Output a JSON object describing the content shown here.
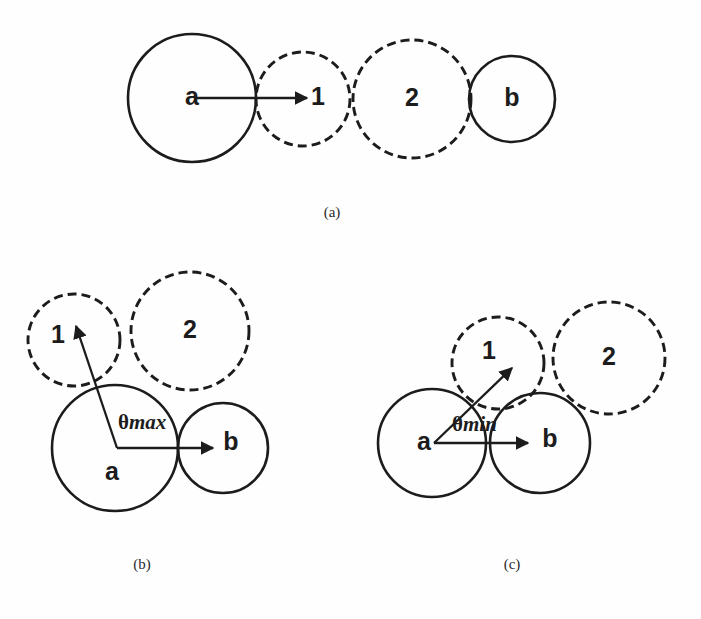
{
  "figure": {
    "title": "",
    "background_color": "#fefefe",
    "stroke_color": "#1c1c1c",
    "width": 701,
    "height": 619
  },
  "panels": [
    {
      "id": "a",
      "caption": "(a)",
      "caption_pos": {
        "x": 332,
        "y": 214
      },
      "description": "collinear arrangement of spheres a, 1, 2, b",
      "circles": [
        {
          "label": "a",
          "cx": 192,
          "cy": 98,
          "r": 64,
          "style": "solid",
          "label_x": 192,
          "label_y": 98
        },
        {
          "label": "1",
          "cx": 303,
          "cy": 99,
          "r": 47,
          "style": "dashed",
          "label_x": 318,
          "label_y": 98
        },
        {
          "label": "2",
          "cx": 412,
          "cy": 99,
          "r": 59,
          "style": "dashed",
          "label_x": 412,
          "label_y": 99
        },
        {
          "label": "b",
          "cx": 512,
          "cy": 99,
          "r": 43,
          "style": "solid",
          "label_x": 512,
          "label_y": 99
        }
      ],
      "vectors": [
        {
          "name": "a-to-1",
          "x1": 195,
          "y1": 98,
          "x2": 307,
          "y2": 98
        }
      ],
      "angle_label": null
    },
    {
      "id": "b",
      "caption": "(b)",
      "caption_pos": {
        "x": 142,
        "y": 566
      },
      "description": "maximum angle configuration",
      "circles": [
        {
          "label": "1",
          "cx": 74,
          "cy": 340,
          "r": 46,
          "style": "dashed",
          "label_x": 58,
          "label_y": 336
        },
        {
          "label": "2",
          "cx": 190,
          "cy": 331,
          "r": 59,
          "style": "dashed",
          "label_x": 190,
          "label_y": 331
        },
        {
          "label": "a",
          "cx": 115,
          "cy": 448,
          "r": 63,
          "style": "solid",
          "label_x": 112,
          "label_y": 473
        },
        {
          "label": "b",
          "cx": 223,
          "cy": 448,
          "r": 45,
          "style": "solid",
          "label_x": 231,
          "label_y": 443
        }
      ],
      "vectors": [
        {
          "name": "a-to-b",
          "x1": 117,
          "y1": 448,
          "x2": 213,
          "y2": 448
        },
        {
          "name": "a-to-1",
          "x1": 117,
          "y1": 448,
          "x2": 76,
          "y2": 326
        }
      ],
      "angle_label": {
        "theta": "θ",
        "sub": "max",
        "x": 118,
        "y": 424
      }
    },
    {
      "id": "c",
      "caption": "(c)",
      "caption_pos": {
        "x": 512,
        "y": 566
      },
      "description": "minimum angle configuration",
      "circles": [
        {
          "label": "1",
          "cx": 498,
          "cy": 363,
          "r": 46,
          "style": "dashed",
          "label_x": 489,
          "label_y": 352
        },
        {
          "label": "2",
          "cx": 609,
          "cy": 358,
          "r": 56,
          "style": "dashed",
          "label_x": 609,
          "label_y": 358
        },
        {
          "label": "a",
          "cx": 432,
          "cy": 443,
          "r": 54,
          "style": "solid",
          "label_x": 424,
          "label_y": 443
        },
        {
          "label": "b",
          "cx": 540,
          "cy": 443,
          "r": 50,
          "style": "solid",
          "label_x": 550,
          "label_y": 440
        }
      ],
      "vectors": [
        {
          "name": "a-to-b",
          "x1": 434,
          "y1": 443,
          "x2": 528,
          "y2": 443
        },
        {
          "name": "a-to-1",
          "x1": 434,
          "y1": 443,
          "x2": 512,
          "y2": 368
        }
      ],
      "angle_label": {
        "theta": "θ",
        "sub": "min",
        "x": 452,
        "y": 426
      }
    }
  ],
  "bottom_caption": {
    "text": "",
    "visible": false
  }
}
